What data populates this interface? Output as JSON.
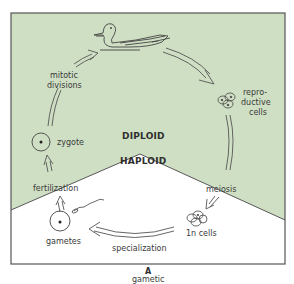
{
  "diagram": {
    "type": "life-cycle",
    "panel_letter": "A",
    "caption": "gametic",
    "regions": {
      "upper": "DIPLOID",
      "lower": "HAPLOID"
    },
    "labels": {
      "mitotic_1": "mitotic",
      "mitotic_2": "divisions",
      "repro_1": "repro-",
      "repro_2": "ductive",
      "repro_3": "cells",
      "meiosis": "meiosis",
      "one_n_cells": "1n cells",
      "specialization": "specialization",
      "gametes": "gametes",
      "fertilization": "fertilization",
      "zygote": "zygote"
    },
    "colors": {
      "diploid_fill": "#cfdfc4",
      "haploid_fill": "#ffffff",
      "stroke": "#555555"
    }
  }
}
